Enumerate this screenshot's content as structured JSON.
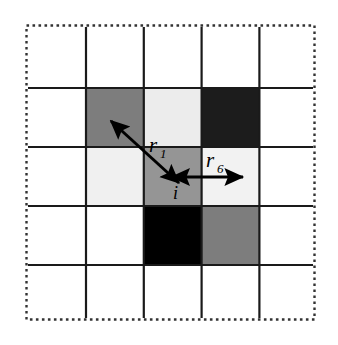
{
  "figure": {
    "name": "lattice-neighbor-distance-diagram",
    "background_color": "#ffffff",
    "outer_boundary": {
      "style": "dotted",
      "color": "#333333",
      "x": 26,
      "y": 25,
      "width": 289,
      "height": 295
    },
    "grid": {
      "rows": 5,
      "cols": 5,
      "line_color": "#1a1a1a",
      "line_width": 2.2,
      "cell_width": 57.8,
      "cell_height": 59.0,
      "x_lines": [
        86,
        143.8,
        201.6,
        259.4
      ],
      "y_lines": [
        88,
        147,
        206,
        265
      ]
    },
    "cells": [
      {
        "name": "cell-r1-c1",
        "row": 1,
        "col": 1,
        "fill": "#7d7d7d",
        "label": ""
      },
      {
        "name": "cell-r1-c2",
        "row": 1,
        "col": 2,
        "fill": "#ececec",
        "label": ""
      },
      {
        "name": "cell-r1-c3",
        "row": 1,
        "col": 3,
        "fill": "#1c1c1c",
        "label": ""
      },
      {
        "name": "cell-r2-c1",
        "row": 2,
        "col": 1,
        "fill": "#f0f0f0",
        "label": ""
      },
      {
        "name": "cell-r2-c2-center",
        "row": 2,
        "col": 2,
        "fill": "#959595",
        "label": "i"
      },
      {
        "name": "cell-r2-c3",
        "row": 2,
        "col": 3,
        "fill": "#f2f2f2",
        "label": ""
      },
      {
        "name": "cell-r3-c2",
        "row": 3,
        "col": 2,
        "fill": "#000000",
        "label": ""
      },
      {
        "name": "cell-r3-c3",
        "row": 3,
        "col": 3,
        "fill": "#7d7d7d",
        "label": ""
      }
    ],
    "arrows": [
      {
        "name": "arrow-r1-diagonal",
        "label": "r",
        "subscript": "1",
        "double_headed": true,
        "from_x": 178,
        "from_y": 182,
        "to_x": 112,
        "to_y": 122,
        "label_x": 152,
        "label_y": 148,
        "color": "#000000"
      },
      {
        "name": "arrow-r6-horizontal",
        "label": "r",
        "subscript": "6",
        "double_headed": true,
        "from_x": 176,
        "from_y": 177,
        "to_x": 240,
        "to_y": 177,
        "label_x": 212,
        "label_y": 163,
        "color": "#000000"
      }
    ],
    "center_site_label": {
      "name": "center-site-label",
      "text": "i",
      "x": 176,
      "y": 196
    }
  }
}
